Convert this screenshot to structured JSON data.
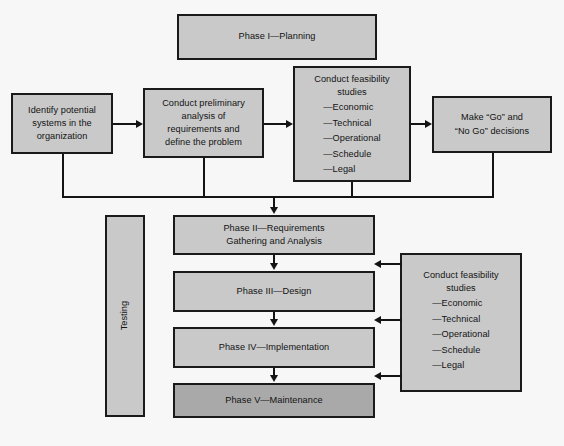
{
  "diagram": {
    "title_box": {
      "label": "Phase I—Planning"
    },
    "planning_row": [
      {
        "id": "identify-potential-systems",
        "lines": [
          "Identify potential",
          "systems in the",
          "organization"
        ]
      },
      {
        "id": "conduct-preliminary-analysis",
        "lines": [
          "Conduct preliminary",
          "analysis of",
          "requirements and",
          "define the problem"
        ]
      },
      {
        "id": "conduct-feasibility-studies-top",
        "heading": [
          "Conduct feasibility",
          "studies"
        ],
        "items": [
          "—Economic",
          "—Technical",
          "—Operational",
          "—Schedule",
          "—Legal"
        ]
      },
      {
        "id": "make-go-no-go-decisions",
        "lines": [
          "Make “Go” and",
          "“No Go” decisions"
        ]
      }
    ],
    "testing_box": {
      "label": "Testing"
    },
    "phase_column": [
      {
        "id": "phase-2",
        "lines": [
          "Phase II—Requirements",
          "Gathering and Analysis"
        ],
        "shade": "light"
      },
      {
        "id": "phase-3",
        "lines": [
          "Phase III—Design"
        ],
        "shade": "light"
      },
      {
        "id": "phase-4",
        "lines": [
          "Phase IV—Implementation"
        ],
        "shade": "light"
      },
      {
        "id": "phase-5",
        "lines": [
          "Phase V—Maintenance"
        ],
        "shade": "dark"
      }
    ],
    "feasibility_right": {
      "id": "conduct-feasibility-studies-right",
      "heading": [
        "Conduct feasibility",
        "studies"
      ],
      "items": [
        "—Economic",
        "—Technical",
        "—Operational",
        "—Schedule",
        "—Legal"
      ]
    },
    "colors": {
      "background": "#f7f7f7",
      "box_fill_light": "#c9c9c9",
      "box_fill_dark": "#a9a9a9",
      "stroke": "#141414",
      "text": "#131313"
    }
  }
}
